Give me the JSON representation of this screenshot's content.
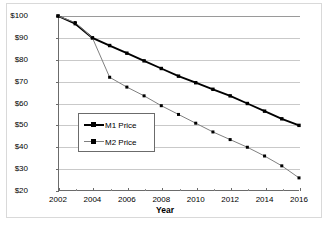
{
  "chart_data": {
    "type": "line",
    "title": "",
    "xlabel": "Year",
    "ylabel": "Price",
    "xlim": [
      2002,
      2016
    ],
    "ylim": [
      20,
      100
    ],
    "grid": true,
    "legend_position": "center-left",
    "x": [
      2002,
      2003,
      2004,
      2005,
      2006,
      2007,
      2008,
      2009,
      2010,
      2011,
      2012,
      2013,
      2014,
      2015,
      2016
    ],
    "xticks": [
      "2002",
      "2004",
      "2006",
      "2008",
      "2010",
      "2012",
      "2014",
      "2016"
    ],
    "yticks": [
      "$20",
      "$30",
      "$40",
      "$50",
      "$60",
      "$70",
      "$80",
      "$90",
      "$100"
    ],
    "series": [
      {
        "name": "M1 Price",
        "color": "#000000",
        "marker": "square",
        "values": [
          100,
          96.5,
          90,
          86.5,
          83,
          79.5,
          76,
          72.5,
          69.5,
          66.5,
          63.5,
          60,
          56.5,
          53,
          50
        ]
      },
      {
        "name": "M2 Price",
        "color": "#808080",
        "marker": "square",
        "values": [
          100,
          97,
          90,
          72,
          67.5,
          63.5,
          59,
          55,
          51,
          47,
          43.5,
          40,
          36,
          31.5,
          26
        ]
      }
    ]
  },
  "legend": {
    "items": [
      {
        "label": "M1 Price"
      },
      {
        "label": "M2 Price"
      }
    ]
  },
  "axes": {
    "y_title": "Price",
    "x_title": "Year"
  },
  "colors": {
    "series_1": "#000000",
    "series_2": "#808080",
    "gridline": "#c9c9c9",
    "axis": "#6b6b6b",
    "figure_border": "#d9d9d9",
    "background": "#ffffff"
  }
}
